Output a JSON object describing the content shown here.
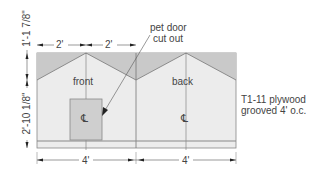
{
  "diagram": {
    "panels": [
      {
        "label": "front",
        "center_mark": "℄"
      },
      {
        "label": "back",
        "center_mark": "℄"
      }
    ],
    "callout": {
      "line1": "pet door",
      "line2": "cut out"
    },
    "note": {
      "line1": "T1-11 plywood",
      "line2": "grooved 4' o.c."
    },
    "dimensions": {
      "top_left": "2'",
      "top_right": "2'",
      "bottom_left": "4'",
      "bottom_right": "4'",
      "vertical_top": "1'-1 7/8\"",
      "vertical_bottom": "2'-10 1/8\""
    },
    "colors": {
      "panel_fill": "#ececec",
      "triangle_fill": "#c9c9c9",
      "door_fill": "#cfcfcf",
      "line": "#777777"
    }
  }
}
